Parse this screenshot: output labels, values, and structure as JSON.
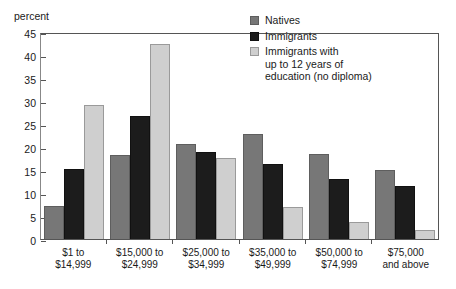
{
  "chart_data": {
    "type": "bar",
    "title": "",
    "subtitle": "",
    "xlabel": "",
    "ylabel": "percent",
    "ylim": [
      0,
      45
    ],
    "ytick_step": 5,
    "yticks": [
      "45",
      "40",
      "35",
      "30",
      "25",
      "20",
      "15",
      "10",
      "5",
      "0"
    ],
    "grid": false,
    "legend_position": "top-right inside plot",
    "categories": [
      "$1 to\n$14,999",
      "$15,000 to\n$24,999",
      "$25,000 to\n$34,999",
      "$35,000 to\n$49,999",
      "$50,000 to\n$74,999",
      "$75,000\nand above"
    ],
    "category_lines": [
      [
        "$1 to",
        "$14,999"
      ],
      [
        "$15,000 to",
        "$24,999"
      ],
      [
        "$25,000 to",
        "$34,999"
      ],
      [
        "$35,000 to",
        "$49,999"
      ],
      [
        "$50,000 to",
        "$74,999"
      ],
      [
        "$75,000",
        "and above"
      ]
    ],
    "series": [
      {
        "name": "Natives",
        "color": "#777777",
        "values": [
          7.1,
          18.3,
          20.6,
          22.8,
          18.4,
          14.9
        ]
      },
      {
        "name": "Immigrants",
        "color": "#1c1c1c",
        "values": [
          15.2,
          26.8,
          19.0,
          16.2,
          13.0,
          11.6
        ]
      },
      {
        "name": "Immigrants with\nup to 12 years of\neducation (no diploma)",
        "color": "#cfcfcf",
        "values": [
          29.2,
          42.5,
          17.7,
          7.0,
          3.8,
          2.0
        ]
      }
    ]
  },
  "legend": {
    "entries": [
      {
        "label": "Natives"
      },
      {
        "label": "Immigrants"
      },
      {
        "label": "Immigrants with\nup to 12 years of\neducation (no diploma)"
      }
    ]
  },
  "colors": {
    "natives": "#777777",
    "immigrants": "#1c1c1c",
    "immigrants_low_education": "#cfcfcf",
    "axis": "#555555",
    "text": "#1a1a1a",
    "background": "#ffffff"
  }
}
